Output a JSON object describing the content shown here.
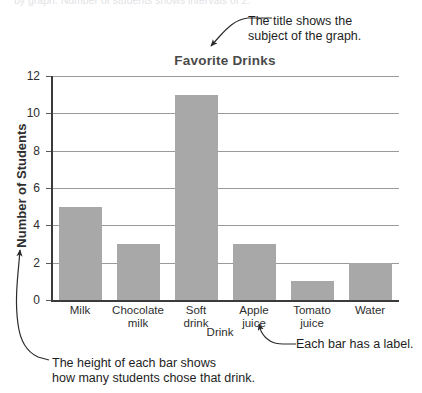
{
  "page": {
    "top_clipped_text": "by graph. Number of students shows intervals of 2."
  },
  "chart_data": {
    "type": "bar",
    "title": "Favorite Drinks",
    "xlabel": "Drink",
    "ylabel": "Number of Students",
    "categories": [
      "Milk",
      "Chocolate milk",
      "Soft drink",
      "Apple juice",
      "Tomato juice",
      "Water"
    ],
    "category_lines": [
      [
        "Milk"
      ],
      [
        "Chocolate",
        "milk"
      ],
      [
        "Soft",
        "drink"
      ],
      [
        "Apple",
        "juice"
      ],
      [
        "Tomato",
        "juice"
      ],
      [
        "Water"
      ]
    ],
    "values": [
      5,
      3,
      11,
      3,
      1,
      2
    ],
    "ylim": [
      0,
      12
    ],
    "ytick_labels": [
      "0",
      "2",
      "4",
      "6",
      "8",
      "10",
      "12"
    ],
    "ytick_values": [
      0,
      2,
      4,
      6,
      8,
      10,
      12
    ],
    "grid": true,
    "legend": "none",
    "bar_color": "#a8a8a8",
    "gridline_color": "#9a9a9a",
    "axis_color": "#3b3b3b",
    "title_color": "#4a4a4a"
  },
  "annotations": {
    "title_note": {
      "line1": "The title shows the",
      "line2": "subject of the graph."
    },
    "bar_label_note": {
      "line1": "Each bar has a label."
    },
    "bar_height_note": {
      "line1": "The height of each bar shows",
      "line2": "how many students chose that drink."
    }
  }
}
